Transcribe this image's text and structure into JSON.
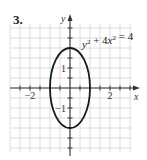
{
  "problem_number": "3.",
  "chart_data": {
    "type": "line",
    "title": "",
    "xlabel": "x",
    "ylabel": "y",
    "xlim": [
      -3,
      3.1
    ],
    "ylim": [
      -3.2,
      3.2
    ],
    "grid": true,
    "grid_step": 0.5,
    "x_tick_step": 0.5,
    "y_tick_step": 0.5,
    "x_tick_labels": [
      {
        "value": -2,
        "label": "−2"
      },
      {
        "value": 2,
        "label": "2"
      }
    ],
    "y_tick_labels": [
      {
        "value": 1,
        "label": "1"
      },
      {
        "value": -1,
        "label": "−1"
      }
    ],
    "annotation": {
      "text": "y² + 4x² = 4",
      "position": "top-right"
    },
    "series": [
      {
        "name": "y² + 4x² = 4",
        "kind": "ellipse",
        "center": [
          0,
          0
        ],
        "semi_axis_x": 1,
        "semi_axis_y": 2,
        "color": "#1a1a1a"
      }
    ]
  }
}
